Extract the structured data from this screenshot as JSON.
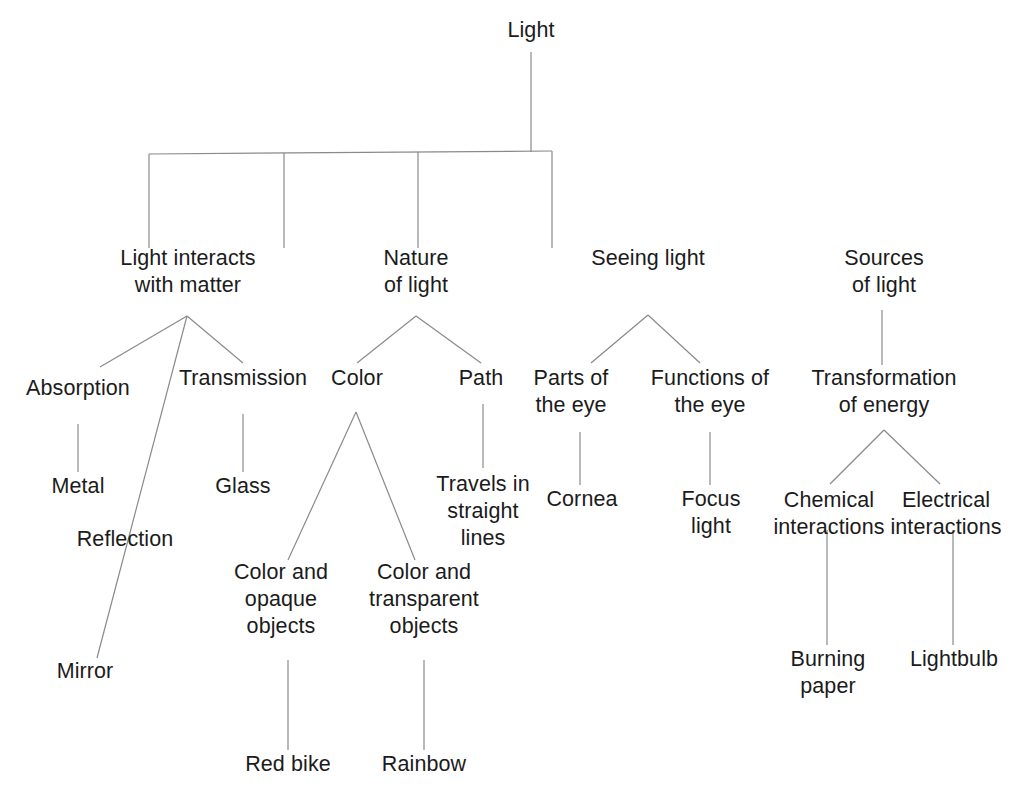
{
  "diagram": {
    "type": "concept-map-tree",
    "canvas": {
      "width": 1026,
      "height": 798
    },
    "style": {
      "background_color": "#ffffff",
      "line_color": "#8a8a8a",
      "text_color": "#1b1b1b",
      "line_width": 1.2,
      "font_size_px": 21.5,
      "line_height_px": 27
    },
    "nodes": [
      {
        "id": "light",
        "label": "Light",
        "lines": [
          "Light"
        ],
        "x": 531,
        "y": 38,
        "level": 0
      },
      {
        "id": "interacts",
        "label": "Light interacts with matter",
        "lines": [
          "Light interacts",
          "with matter"
        ],
        "x": 188,
        "y": 266,
        "level": 1
      },
      {
        "id": "nature",
        "label": "Nature of light",
        "lines": [
          "Nature",
          "of light"
        ],
        "x": 416,
        "y": 266,
        "level": 1
      },
      {
        "id": "seeing",
        "label": "Seeing light",
        "lines": [
          "Seeing light"
        ],
        "x": 648,
        "y": 266,
        "level": 1
      },
      {
        "id": "sources",
        "label": "Sources of light",
        "lines": [
          "Sources",
          "of light"
        ],
        "x": 884,
        "y": 266,
        "level": 1
      },
      {
        "id": "absorption",
        "label": "Absorption",
        "lines": [
          "Absorption"
        ],
        "x": 78,
        "y": 396,
        "level": 2
      },
      {
        "id": "reflection",
        "label": "Reflection",
        "lines": [
          "Reflection"
        ],
        "x": 125,
        "y": 547,
        "level": 2
      },
      {
        "id": "transmission",
        "label": "Transmission",
        "lines": [
          "Transmission"
        ],
        "x": 243,
        "y": 386,
        "level": 2
      },
      {
        "id": "color",
        "label": "Color",
        "lines": [
          "Color"
        ],
        "x": 357,
        "y": 386,
        "level": 2
      },
      {
        "id": "path",
        "label": "Path",
        "lines": [
          "Path"
        ],
        "x": 481,
        "y": 386,
        "level": 2
      },
      {
        "id": "parts-of-eye",
        "label": "Parts of the eye",
        "lines": [
          "Parts of",
          "the eye"
        ],
        "x": 571,
        "y": 386,
        "level": 2
      },
      {
        "id": "functions-of-eye",
        "label": "Functions of the eye",
        "lines": [
          "Functions of",
          "the eye"
        ],
        "x": 710,
        "y": 386,
        "level": 2
      },
      {
        "id": "transformation",
        "label": "Transformation of energy",
        "lines": [
          "Transformation",
          "of energy"
        ],
        "x": 884,
        "y": 386,
        "level": 2
      },
      {
        "id": "metal",
        "label": "Metal",
        "lines": [
          "Metal"
        ],
        "x": 78,
        "y": 494,
        "level": 3
      },
      {
        "id": "mirror",
        "label": "Mirror",
        "lines": [
          "Mirror"
        ],
        "x": 85,
        "y": 679,
        "level": 3
      },
      {
        "id": "glass",
        "label": "Glass",
        "lines": [
          "Glass"
        ],
        "x": 243,
        "y": 494,
        "level": 3
      },
      {
        "id": "color-opaque",
        "label": "Color and opaque objects",
        "lines": [
          "Color and",
          "opaque",
          "objects"
        ],
        "x": 281,
        "y": 580,
        "level": 3
      },
      {
        "id": "color-transparent",
        "label": "Color and transparent objects",
        "lines": [
          "Color and",
          "transparent",
          "objects"
        ],
        "x": 424,
        "y": 580,
        "level": 3
      },
      {
        "id": "travels-straight",
        "label": "Travels in straight lines",
        "lines": [
          "Travels in",
          "straight",
          "lines"
        ],
        "x": 483,
        "y": 492,
        "level": 3
      },
      {
        "id": "cornea",
        "label": "Cornea",
        "lines": [
          "Cornea"
        ],
        "x": 582,
        "y": 507,
        "level": 3
      },
      {
        "id": "focus-light",
        "label": "Focus light",
        "lines": [
          "Focus",
          "light"
        ],
        "x": 711,
        "y": 507,
        "level": 3
      },
      {
        "id": "chemical-interactions",
        "label": "Chemical interactions",
        "lines": [
          "Chemical",
          "interactions"
        ],
        "x": 829,
        "y": 508,
        "level": 3
      },
      {
        "id": "electrical-interactions",
        "label": "Electrical interactions",
        "lines": [
          "Electrical",
          "interactions"
        ],
        "x": 946,
        "y": 508,
        "level": 3
      },
      {
        "id": "red-bike",
        "label": "Red bike",
        "lines": [
          "Red bike"
        ],
        "x": 288,
        "y": 772,
        "level": 4
      },
      {
        "id": "rainbow",
        "label": "Rainbow",
        "lines": [
          "Rainbow"
        ],
        "x": 424,
        "y": 772,
        "level": 4
      },
      {
        "id": "burning-paper",
        "label": "Burning paper",
        "lines": [
          "Burning",
          "paper"
        ],
        "x": 828,
        "y": 667,
        "level": 4
      },
      {
        "id": "lightbulb",
        "label": "Lightbulb",
        "lines": [
          "Lightbulb"
        ],
        "x": 954,
        "y": 667,
        "level": 4
      }
    ],
    "edges": [
      {
        "from": "light",
        "to": "bus",
        "points": [
          [
            531,
            52
          ],
          [
            531,
            152
          ]
        ]
      },
      {
        "from": "bus",
        "to": "bus-span",
        "points": [
          [
            149,
            154
          ],
          [
            552,
            151
          ]
        ]
      },
      {
        "from": "bus",
        "to": "interacts",
        "points": [
          [
            149,
            154
          ],
          [
            149,
            248
          ]
        ]
      },
      {
        "from": "bus",
        "to": "nature",
        "points": [
          [
            284,
            153
          ],
          [
            284,
            248
          ]
        ]
      },
      {
        "from": "bus",
        "to": "seeing",
        "points": [
          [
            418,
            152
          ],
          [
            418,
            248
          ]
        ]
      },
      {
        "from": "bus",
        "to": "sources",
        "points": [
          [
            552,
            151
          ],
          [
            552,
            248
          ]
        ]
      },
      {
        "from": "interacts",
        "to": "absorption",
        "points": [
          [
            187,
            316
          ],
          [
            100,
            367
          ]
        ]
      },
      {
        "from": "interacts",
        "to": "transmission",
        "points": [
          [
            187,
            316
          ],
          [
            243,
            363
          ]
        ]
      },
      {
        "from": "interacts",
        "to": "mirror",
        "points": [
          [
            187,
            316
          ],
          [
            97,
            658
          ]
        ]
      },
      {
        "from": "absorption",
        "to": "metal",
        "points": [
          [
            78,
            424
          ],
          [
            78,
            472
          ]
        ]
      },
      {
        "from": "transmission",
        "to": "glass",
        "points": [
          [
            243,
            414
          ],
          [
            243,
            472
          ]
        ]
      },
      {
        "from": "nature",
        "to": "color",
        "points": [
          [
            416,
            316
          ],
          [
            357,
            363
          ]
        ]
      },
      {
        "from": "nature",
        "to": "path",
        "points": [
          [
            416,
            316
          ],
          [
            481,
            363
          ]
        ]
      },
      {
        "from": "color",
        "to": "color-opaque",
        "points": [
          [
            356,
            412
          ],
          [
            288,
            560
          ]
        ]
      },
      {
        "from": "color",
        "to": "color-transparent",
        "points": [
          [
            356,
            412
          ],
          [
            415,
            560
          ]
        ]
      },
      {
        "from": "path",
        "to": "travels-straight",
        "points": [
          [
            483,
            404
          ],
          [
            483,
            468
          ]
        ]
      },
      {
        "from": "color-opaque",
        "to": "red-bike",
        "points": [
          [
            288,
            660
          ],
          [
            288,
            750
          ]
        ]
      },
      {
        "from": "color-transparent",
        "to": "rainbow",
        "points": [
          [
            424,
            660
          ],
          [
            424,
            750
          ]
        ]
      },
      {
        "from": "seeing",
        "to": "parts-of-eye",
        "points": [
          [
            648,
            315
          ],
          [
            591,
            363
          ]
        ]
      },
      {
        "from": "seeing",
        "to": "functions-of-eye",
        "points": [
          [
            648,
            315
          ],
          [
            700,
            363
          ]
        ]
      },
      {
        "from": "parts-of-eye",
        "to": "cornea",
        "points": [
          [
            580,
            432
          ],
          [
            580,
            485
          ]
        ]
      },
      {
        "from": "functions-of-eye",
        "to": "focus-light",
        "points": [
          [
            710,
            432
          ],
          [
            710,
            485
          ]
        ]
      },
      {
        "from": "sources",
        "to": "transformation",
        "points": [
          [
            882,
            310
          ],
          [
            882,
            365
          ]
        ]
      },
      {
        "from": "transformation",
        "to": "chemical-interactions",
        "points": [
          [
            884,
            430
          ],
          [
            830,
            484
          ]
        ]
      },
      {
        "from": "transformation",
        "to": "electrical-interactions",
        "points": [
          [
            884,
            430
          ],
          [
            940,
            484
          ]
        ]
      },
      {
        "from": "chemical-interactions",
        "to": "burning-paper",
        "points": [
          [
            827,
            530
          ],
          [
            827,
            645
          ]
        ]
      },
      {
        "from": "electrical-interactions",
        "to": "lightbulb",
        "points": [
          [
            953,
            530
          ],
          [
            953,
            645
          ]
        ]
      }
    ]
  }
}
